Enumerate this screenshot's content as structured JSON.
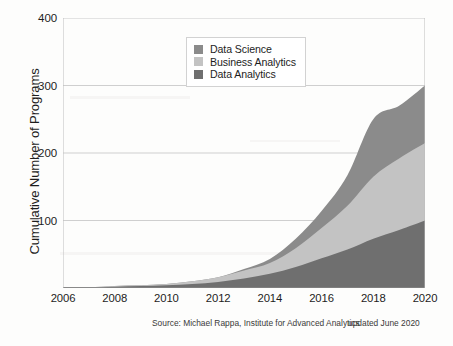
{
  "chart_data": {
    "type": "area",
    "stacked": true,
    "title": "",
    "xlabel": "",
    "ylabel": "Cumulative Number of Programs",
    "xlim": [
      2006,
      2020
    ],
    "ylim": [
      0,
      400
    ],
    "ytick_labels": [
      "100",
      "200",
      "300",
      "400"
    ],
    "yticks": [
      100,
      200,
      300,
      400
    ],
    "xtick_labels": [
      "2006",
      "2008",
      "2010",
      "2012",
      "2014",
      "2016",
      "2018",
      "2020"
    ],
    "xticks": [
      2006,
      2008,
      2010,
      2012,
      2014,
      2016,
      2018,
      2020
    ],
    "grid": true,
    "grid_axis": "y",
    "legend_position": "upper center",
    "x": [
      2006,
      2007,
      2008,
      2009,
      2010,
      2011,
      2012,
      2013,
      2014,
      2015,
      2016,
      2017,
      2018,
      2019,
      2020
    ],
    "series": [
      {
        "name": "Data Analytics",
        "color": "#6f6f6f",
        "stack_order": 1,
        "values": [
          1,
          1,
          2,
          3,
          4,
          6,
          9,
          14,
          21,
          31,
          44,
          57,
          73,
          86,
          100
        ]
      },
      {
        "name": "Business Analytics",
        "color": "#c3c3c3",
        "stack_order": 2,
        "values": [
          0,
          0,
          1,
          1,
          2,
          4,
          7,
          12,
          16,
          28,
          45,
          65,
          92,
          106,
          115
        ]
      },
      {
        "name": "Data Science",
        "color": "#8b8b8b",
        "stack_order": 3,
        "values": [
          0,
          0,
          0,
          0,
          0,
          0,
          0,
          2,
          6,
          14,
          25,
          45,
          85,
          78,
          85
        ]
      }
    ],
    "cumulative_totals": [
      1,
      1,
      3,
      4,
      6,
      10,
      16,
      28,
      43,
      73,
      114,
      167,
      250,
      270,
      300
    ]
  },
  "legend": {
    "items": [
      {
        "label": "Data Science",
        "color": "#8b8b8b"
      },
      {
        "label": "Business Analytics",
        "color": "#c3c3c3"
      },
      {
        "label": "Data Analytics",
        "color": "#6f6f6f"
      }
    ]
  },
  "footer": {
    "source": "Source: Michael Rappa, Institute for Advanced Analytics",
    "updated": "updated June 2020"
  },
  "colors": {
    "grid": "#cfcfcf",
    "axis": "#9a9a9a",
    "text": "#1d1d1d",
    "background": "#fdfdfc"
  }
}
